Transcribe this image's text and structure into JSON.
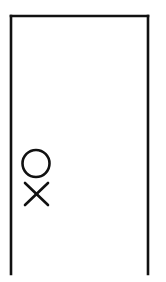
{
  "figure": {
    "title": "Open rectangle with circle and cross marks",
    "type": "line-drawing",
    "canvas": {
      "width": 166,
      "height": 282,
      "background_color": "#ffffff"
    },
    "ink_color": "#111111",
    "shapes": {
      "enclosure": {
        "label": "Open-bottom rectangle",
        "description": "Three-sided rectangle: top edge plus left and right vertical edges, open at the bottom",
        "stroke_width": 2.6,
        "left_x": 11,
        "right_x": 148,
        "top_y": 16,
        "bottom_y": 274,
        "closed_bottom": false
      },
      "circle": {
        "label": "Circle mark",
        "center_x": 36,
        "center_y": 163.5,
        "radius": 13.5,
        "stroke_width": 2.6,
        "fill": "none"
      },
      "cross": {
        "label": "X mark",
        "center_x": 36.5,
        "center_y": 194,
        "half_width": 11.5,
        "half_height": 11,
        "stroke_width": 2.6
      }
    }
  }
}
